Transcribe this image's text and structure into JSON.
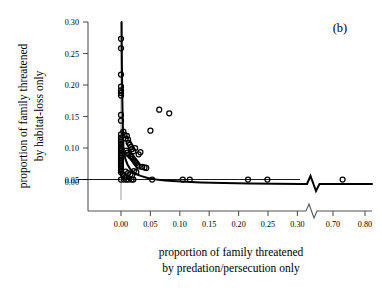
{
  "panel": {
    "label": "(b)"
  },
  "chart_data": {
    "type": "scatter",
    "title": "",
    "xlabel_line1": "proportion of family threatened",
    "xlabel_line2": "by predation/persecution only",
    "ylabel_line1": "proportion of family threatened",
    "ylabel_line2": "by habitat-loss only",
    "xlim": [
      -0.02,
      0.8
    ],
    "ylim": [
      0.0,
      0.3
    ],
    "xticks": [
      0.0,
      0.05,
      0.1,
      0.15,
      0.2,
      0.25,
      0.3,
      0.7,
      0.8
    ],
    "xticklabels": [
      "0.00",
      "0.05",
      "0.10",
      "0.15",
      "0.20",
      "0.25",
      "0.30",
      "0.70",
      "0.80"
    ],
    "yticks": [
      0.0,
      0.05,
      0.1,
      0.15,
      0.2,
      0.25,
      0.3
    ],
    "yticklabels": [
      "0.00",
      "0.05",
      "0.10",
      "0.15",
      "0.20",
      "0.25",
      "0.30"
    ],
    "axis_break": {
      "present": true,
      "after_tick": 0.3,
      "before_tick": 0.7,
      "style": "zigzag"
    },
    "grid": false,
    "legend": null,
    "marker": "open-circle",
    "points": [
      [
        0.0,
        0.268
      ],
      [
        0.0,
        0.25
      ],
      [
        0.0,
        0.2
      ],
      [
        0.0,
        0.177
      ],
      [
        0.0,
        0.17
      ],
      [
        0.0,
        0.165
      ],
      [
        0.0,
        0.16
      ],
      [
        0.0,
        0.123
      ],
      [
        0.0,
        0.112
      ],
      [
        0.0,
        0.086
      ],
      [
        0.0,
        0.08
      ],
      [
        0.0,
        0.075
      ],
      [
        0.0,
        0.072
      ],
      [
        0.0,
        0.068
      ],
      [
        0.0,
        0.063
      ],
      [
        0.0,
        0.06
      ],
      [
        0.0,
        0.057
      ],
      [
        0.0,
        0.054
      ],
      [
        0.0,
        0.05
      ],
      [
        0.0,
        0.047
      ],
      [
        0.0,
        0.044
      ],
      [
        0.0,
        0.041
      ],
      [
        0.0,
        0.038
      ],
      [
        0.0,
        0.035
      ],
      [
        0.0,
        0.032
      ],
      [
        0.0,
        0.029
      ],
      [
        0.0,
        0.026
      ],
      [
        0.0,
        0.023
      ],
      [
        0.0,
        0.02
      ],
      [
        0.0,
        0.017
      ],
      [
        0.0,
        0.014
      ],
      [
        0.0,
        0.0
      ],
      [
        0.004,
        0.091
      ],
      [
        0.006,
        0.085
      ],
      [
        0.008,
        0.078
      ],
      [
        0.01,
        0.083
      ],
      [
        0.012,
        0.076
      ],
      [
        0.013,
        0.07
      ],
      [
        0.015,
        0.066
      ],
      [
        0.017,
        0.062
      ],
      [
        0.019,
        0.058
      ],
      [
        0.021,
        0.054
      ],
      [
        0.009,
        0.055
      ],
      [
        0.011,
        0.051
      ],
      [
        0.013,
        0.048
      ],
      [
        0.016,
        0.045
      ],
      [
        0.018,
        0.043
      ],
      [
        0.02,
        0.04
      ],
      [
        0.022,
        0.037
      ],
      [
        0.024,
        0.034
      ],
      [
        0.026,
        0.031
      ],
      [
        0.028,
        0.028
      ],
      [
        0.03,
        0.025
      ],
      [
        0.033,
        0.052
      ],
      [
        0.03,
        0.048
      ],
      [
        0.024,
        0.06
      ],
      [
        0.036,
        0.024
      ],
      [
        0.04,
        0.023
      ],
      [
        0.043,
        0.022
      ],
      [
        0.05,
        0.093
      ],
      [
        0.065,
        0.133
      ],
      [
        0.082,
        0.126
      ],
      [
        0.008,
        0.015
      ],
      [
        0.012,
        0.012
      ],
      [
        0.016,
        0.01
      ],
      [
        0.019,
        0.008
      ],
      [
        0.022,
        0.016
      ],
      [
        0.026,
        0.014
      ],
      [
        0.005,
        0.007
      ],
      [
        0.007,
        0.004
      ],
      [
        0.003,
        0.01
      ],
      [
        0.005,
        0.0
      ],
      [
        0.009,
        0.0
      ],
      [
        0.013,
        0.0
      ],
      [
        0.018,
        0.0
      ],
      [
        0.021,
        0.0
      ],
      [
        0.053,
        0.0
      ],
      [
        0.105,
        0.0
      ],
      [
        0.117,
        0.0
      ],
      [
        0.216,
        0.0
      ],
      [
        0.249,
        0.0
      ],
      [
        0.73,
        0.0
      ]
    ],
    "fit_curve": {
      "description": "decaying hyperbolic fit rising steeply at x=0 and flattening toward y=0",
      "x": [
        0.0,
        0.002,
        0.004,
        0.006,
        0.009,
        0.012,
        0.016,
        0.02,
        0.025,
        0.03,
        0.04,
        0.05,
        0.065,
        0.08,
        0.1,
        0.13,
        0.16,
        0.2,
        0.25,
        0.3,
        0.7,
        0.8
      ],
      "y": [
        0.3,
        0.12,
        0.075,
        0.06,
        0.052,
        0.048,
        0.044,
        0.041,
        0.038,
        0.035,
        0.031,
        0.028,
        0.024,
        0.021,
        0.018,
        0.014,
        0.012,
        0.009,
        0.007,
        0.005,
        0.0,
        0.0
      ]
    }
  }
}
